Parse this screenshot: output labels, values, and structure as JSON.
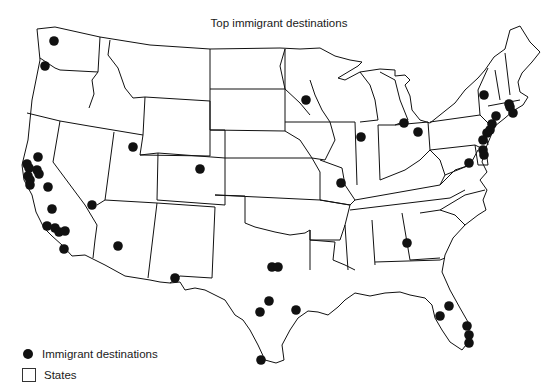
{
  "title": "Top immigrant destinations",
  "legend": {
    "items": [
      {
        "symbol": "filled-circle",
        "label": "Immigrant destinations"
      },
      {
        "symbol": "empty-square",
        "label": "States"
      }
    ]
  },
  "colors": {
    "background": "#ffffff",
    "state_outline": "#111111",
    "dot": "#111111"
  },
  "map": {
    "region": "Contiguous United States",
    "dots": [
      {
        "x": 54,
        "y": 41
      },
      {
        "x": 45,
        "y": 66
      },
      {
        "x": 38,
        "y": 157
      },
      {
        "x": 27,
        "y": 164
      },
      {
        "x": 29,
        "y": 168
      },
      {
        "x": 37,
        "y": 170
      },
      {
        "x": 39,
        "y": 174
      },
      {
        "x": 28,
        "y": 176
      },
      {
        "x": 30,
        "y": 180
      },
      {
        "x": 30,
        "y": 185
      },
      {
        "x": 48,
        "y": 187
      },
      {
        "x": 52,
        "y": 209
      },
      {
        "x": 47,
        "y": 226
      },
      {
        "x": 55,
        "y": 228
      },
      {
        "x": 59,
        "y": 232
      },
      {
        "x": 65,
        "y": 231
      },
      {
        "x": 64,
        "y": 249
      },
      {
        "x": 92,
        "y": 205
      },
      {
        "x": 133,
        "y": 147
      },
      {
        "x": 200,
        "y": 169
      },
      {
        "x": 118,
        "y": 246
      },
      {
        "x": 175,
        "y": 278
      },
      {
        "x": 272,
        "y": 267
      },
      {
        "x": 278,
        "y": 267
      },
      {
        "x": 269,
        "y": 301
      },
      {
        "x": 260,
        "y": 312
      },
      {
        "x": 296,
        "y": 310
      },
      {
        "x": 261,
        "y": 360
      },
      {
        "x": 306,
        "y": 100
      },
      {
        "x": 341,
        "y": 183
      },
      {
        "x": 361,
        "y": 137
      },
      {
        "x": 404,
        "y": 123
      },
      {
        "x": 418,
        "y": 132
      },
      {
        "x": 407,
        "y": 243
      },
      {
        "x": 449,
        "y": 306
      },
      {
        "x": 440,
        "y": 316
      },
      {
        "x": 467,
        "y": 326
      },
      {
        "x": 469,
        "y": 335
      },
      {
        "x": 469,
        "y": 343
      },
      {
        "x": 484,
        "y": 95
      },
      {
        "x": 510,
        "y": 107
      },
      {
        "x": 509,
        "y": 104
      },
      {
        "x": 513,
        "y": 113
      },
      {
        "x": 496,
        "y": 116
      },
      {
        "x": 492,
        "y": 124
      },
      {
        "x": 490,
        "y": 130
      },
      {
        "x": 487,
        "y": 133
      },
      {
        "x": 483,
        "y": 140
      },
      {
        "x": 483,
        "y": 150
      },
      {
        "x": 484,
        "y": 155
      },
      {
        "x": 469,
        "y": 163
      }
    ]
  }
}
